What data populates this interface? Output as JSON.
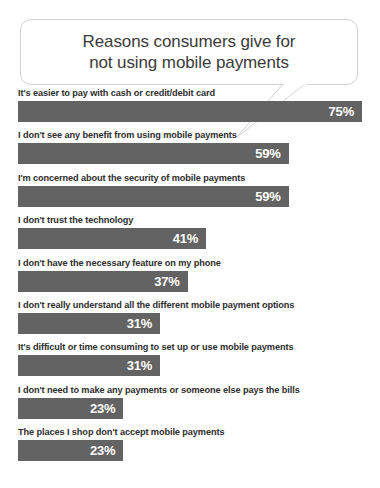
{
  "title": {
    "line1": "Reasons consumers give for",
    "line2": "not using mobile payments"
  },
  "colors": {
    "bar": "#636363",
    "bar_value_text": "#ffffff",
    "label_text": "#2e2e2e",
    "title_text": "#3b3b3b",
    "bubble_border": "#d2d2d2",
    "background": "#ffffff"
  },
  "chart_data": {
    "type": "bar",
    "orientation": "horizontal",
    "title": "Reasons consumers give for not using mobile payments",
    "xlabel": "",
    "ylabel": "",
    "xlim": [
      0,
      75
    ],
    "grid": false,
    "legend": false,
    "value_suffix": "%",
    "categories": [
      "It's easier to pay with cash or credit/debit card",
      "I don't see any benefit from using mobile payments",
      "I'm concerned about the security of mobile payments",
      "I don't trust the technology",
      "I don't have the necessary feature on my phone",
      "I don't really understand all the different mobile payment options",
      "It's difficult or time consuming to set up or use mobile payments",
      "I don't need to make any payments or someone else pays the bills",
      "The places I shop don't accept mobile payments"
    ],
    "values": [
      75,
      59,
      59,
      41,
      37,
      31,
      31,
      23,
      23
    ],
    "labels": [
      "75%",
      "59%",
      "59%",
      "41%",
      "37%",
      "31%",
      "31%",
      "23%",
      "23%"
    ]
  }
}
